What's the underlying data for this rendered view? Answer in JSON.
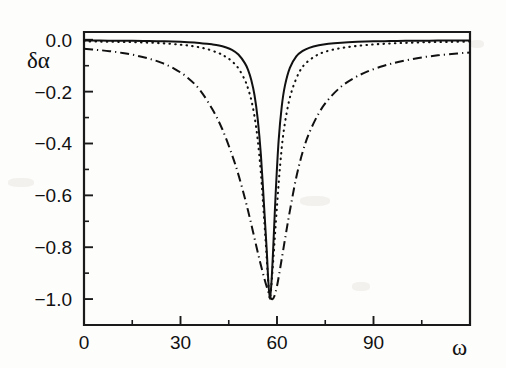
{
  "figure": {
    "background_color": "#fdfdfc",
    "ink_color": "#111111",
    "y_axis_label": "δα",
    "x_axis_label": "ω"
  },
  "axes": {
    "x_tick_labels": [
      "0",
      "30",
      "60",
      "90"
    ],
    "x_tick_values": [
      0,
      30,
      60,
      90
    ],
    "x_minor_tick_values": [
      15,
      45,
      75,
      105
    ],
    "y_tick_labels": [
      "0.0",
      "−0.2",
      "−0.4",
      "−0.6",
      "−0.8",
      "−1.0"
    ],
    "y_tick_values": [
      0.0,
      -0.2,
      -0.4,
      -0.6,
      -0.8,
      -1.0
    ],
    "y_minor_tick_values": [
      -0.1,
      -0.3,
      -0.5,
      -0.7,
      -0.9
    ]
  },
  "chart_data": {
    "type": "line",
    "title": "",
    "xlabel": "ω",
    "ylabel": "δα",
    "xlim": [
      0,
      120
    ],
    "ylim": [
      -1.1,
      0.03
    ],
    "grid": false,
    "legend": "none",
    "frame": "box",
    "annotations": [],
    "series": [
      {
        "name": "solid",
        "style": "solid",
        "center": 57.8,
        "depth": -1.0,
        "halfwidth": 3.1,
        "x": [
          0,
          5,
          10,
          15,
          20,
          25,
          30,
          35,
          40,
          42,
          44,
          46,
          48,
          50,
          51,
          52,
          53,
          54,
          55,
          56,
          56.8,
          57.3,
          57.8,
          58.3,
          58.8,
          59.6,
          60.5,
          61.5,
          62.5,
          64,
          66,
          68,
          70,
          73,
          76,
          80,
          85,
          90,
          95,
          100,
          105,
          110,
          115,
          120
        ],
        "y": [
          -0.003,
          -0.003,
          -0.004,
          -0.004,
          -0.005,
          -0.006,
          -0.008,
          -0.011,
          -0.018,
          -0.022,
          -0.029,
          -0.039,
          -0.057,
          -0.09,
          -0.116,
          -0.155,
          -0.213,
          -0.305,
          -0.445,
          -0.645,
          -0.81,
          -0.93,
          -1.0,
          -0.93,
          -0.81,
          -0.59,
          -0.39,
          -0.255,
          -0.175,
          -0.108,
          -0.064,
          -0.043,
          -0.031,
          -0.021,
          -0.015,
          -0.011,
          -0.008,
          -0.006,
          -0.005,
          -0.004,
          -0.004,
          -0.003,
          -0.003,
          -0.003
        ]
      },
      {
        "name": "dotted",
        "style": "dotted",
        "center": 57.8,
        "depth": -1.0,
        "halfwidth": 4.6,
        "x": [
          0,
          5,
          10,
          15,
          20,
          25,
          30,
          34,
          38,
          42,
          44,
          46,
          48,
          50,
          51,
          52,
          53,
          54,
          55,
          56,
          56.8,
          57.3,
          57.8,
          58.3,
          59,
          60,
          61,
          62,
          63.5,
          65,
          67,
          69,
          72,
          75,
          79,
          84,
          90,
          96,
          102,
          108,
          114,
          120
        ],
        "y": [
          -0.006,
          -0.007,
          -0.008,
          -0.009,
          -0.011,
          -0.014,
          -0.019,
          -0.025,
          -0.035,
          -0.052,
          -0.065,
          -0.083,
          -0.11,
          -0.155,
          -0.188,
          -0.232,
          -0.295,
          -0.385,
          -0.515,
          -0.69,
          -0.84,
          -0.94,
          -1.0,
          -0.94,
          -0.82,
          -0.64,
          -0.48,
          -0.36,
          -0.25,
          -0.182,
          -0.123,
          -0.09,
          -0.062,
          -0.046,
          -0.034,
          -0.025,
          -0.018,
          -0.014,
          -0.011,
          -0.009,
          -0.008,
          -0.007
        ]
      },
      {
        "name": "dash-dot",
        "style": "dash-dot",
        "center": 58.6,
        "depth": -1.0,
        "halfwidth": 9.5,
        "x": [
          0,
          4,
          8,
          12,
          16,
          20,
          24,
          28,
          32,
          36,
          40,
          43,
          46,
          48,
          50,
          51.5,
          53,
          54.5,
          56,
          57.2,
          58.0,
          58.6,
          59.2,
          60,
          61,
          62.5,
          64,
          66,
          68,
          70,
          73,
          76,
          80,
          84,
          88,
          93,
          98,
          104,
          110,
          116,
          120
        ],
        "y": [
          -0.035,
          -0.039,
          -0.044,
          -0.051,
          -0.06,
          -0.072,
          -0.088,
          -0.111,
          -0.144,
          -0.193,
          -0.27,
          -0.345,
          -0.443,
          -0.52,
          -0.61,
          -0.685,
          -0.765,
          -0.845,
          -0.918,
          -0.968,
          -0.995,
          -1.0,
          -0.988,
          -0.95,
          -0.88,
          -0.768,
          -0.66,
          -0.53,
          -0.432,
          -0.36,
          -0.283,
          -0.23,
          -0.18,
          -0.147,
          -0.123,
          -0.101,
          -0.085,
          -0.07,
          -0.06,
          -0.053,
          -0.049
        ]
      }
    ]
  }
}
